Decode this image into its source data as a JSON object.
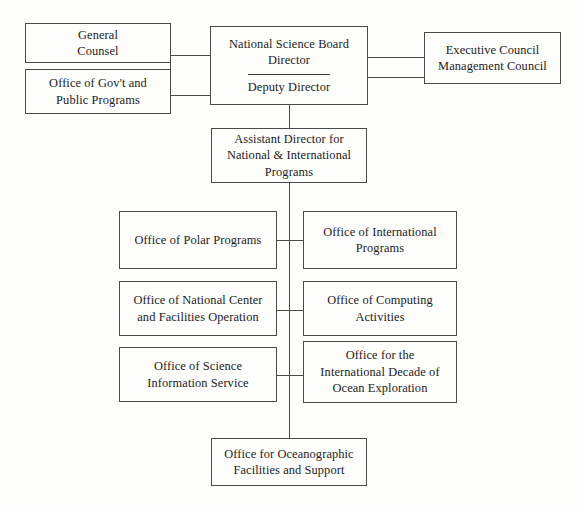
{
  "chart": {
    "type": "org-chart",
    "background_color": "#fdfdfb",
    "line_color": "#4a4a4a",
    "text_color": "#1c1c1c"
  },
  "nodes": {
    "general_counsel": {
      "line1": "General",
      "line2": "Counsel"
    },
    "gov_public_programs": {
      "line1": "Office of Gov't and",
      "line2": "Public Programs"
    },
    "director": {
      "line1": "National Science Board",
      "line2": "Director",
      "line3": "Deputy Director"
    },
    "executive_council": {
      "line1": "Executive Council",
      "line2": "Management Council"
    },
    "assistant_director": {
      "line1": "Assistant Director for",
      "line2": "National & International",
      "line3": "Programs"
    },
    "polar_programs": {
      "line1": "Office of Polar Programs"
    },
    "international_programs": {
      "line1": "Office of International",
      "line2": "Programs"
    },
    "national_center": {
      "line1": "Office of National Center",
      "line2": "and Facilities Operation"
    },
    "computing_activities": {
      "line1": "Office of Computing",
      "line2": "Activities"
    },
    "science_information": {
      "line1": "Office of Science",
      "line2": "Information Service"
    },
    "ocean_exploration": {
      "line1": "Office for the",
      "line2": "International Decade of",
      "line3": "Ocean Exploration"
    },
    "oceanographic_facilities": {
      "line1": "Office for Oceanographic",
      "line2": "Facilities and Support"
    }
  }
}
